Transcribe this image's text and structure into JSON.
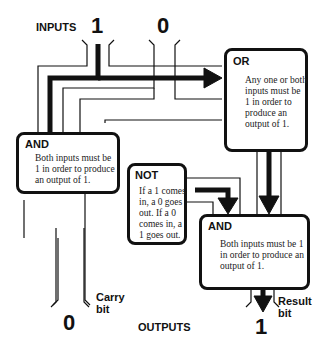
{
  "labels": {
    "inputs": "INPUTS",
    "outputs": "OUTPUTS",
    "input_a": "1",
    "input_b": "0",
    "carry_value": "0",
    "result_value": "1",
    "carry_label_1": "Carry",
    "carry_label_2": "bit",
    "result_label_1": "Result",
    "result_label_2": "bit"
  },
  "gates": {
    "or": {
      "title": "OR",
      "desc": "Any one or both inputs must be 1 in order to produce an output of 1."
    },
    "and_left": {
      "title": "AND",
      "desc": "Both inputs must be 1 in order to produce an output of 1."
    },
    "not": {
      "title": "NOT",
      "desc": "If a 1 comes in, a 0 goes out. If a 0 comes in, a 1 goes out."
    },
    "and_right": {
      "title": "AND",
      "desc": "Both inputs must be 1 in order to produce an output of 1."
    }
  },
  "colors": {
    "ink": "#111111",
    "background": "#ffffff"
  }
}
